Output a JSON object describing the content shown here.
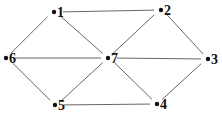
{
  "diagram": {
    "type": "graph",
    "nodes": [
      {
        "id": "1",
        "label": "1",
        "x": 54,
        "y": 12
      },
      {
        "id": "2",
        "label": "2",
        "x": 161,
        "y": 10
      },
      {
        "id": "3",
        "label": "3",
        "x": 208,
        "y": 59
      },
      {
        "id": "4",
        "label": "4",
        "x": 157,
        "y": 104
      },
      {
        "id": "5",
        "label": "5",
        "x": 55,
        "y": 105
      },
      {
        "id": "6",
        "label": "6",
        "x": 6,
        "y": 58
      },
      {
        "id": "7",
        "label": "7",
        "x": 108,
        "y": 58
      }
    ],
    "edges": [
      [
        "1",
        "2"
      ],
      [
        "1",
        "6"
      ],
      [
        "1",
        "7"
      ],
      [
        "2",
        "7"
      ],
      [
        "2",
        "3"
      ],
      [
        "6",
        "7"
      ],
      [
        "7",
        "3"
      ],
      [
        "6",
        "5"
      ],
      [
        "5",
        "7"
      ],
      [
        "5",
        "4"
      ],
      [
        "7",
        "4"
      ],
      [
        "3",
        "4"
      ]
    ],
    "colors": {
      "edge": "#555555",
      "node": "#111111"
    }
  }
}
